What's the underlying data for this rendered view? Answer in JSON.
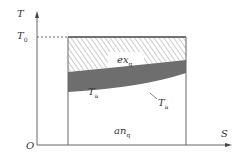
{
  "diagram": {
    "type": "T-S diagram (exergy / anergy of heat)",
    "axes": {
      "y_label": "T",
      "x_label": "S",
      "origin_label": "O",
      "reference_temperature_label": "T",
      "reference_temperature_sub": "0"
    },
    "regions": {
      "exergy": {
        "label": "ex",
        "sub": "q",
        "fill": "hatched"
      },
      "anergy": {
        "label": "an",
        "sub": "q",
        "fill": "#ffffff"
      },
      "band": {
        "label": "T",
        "sub": "a",
        "fill": "#6e6e6e"
      }
    },
    "curve_label": {
      "label": "T",
      "sub": "a",
      "prime": "′"
    },
    "colors": {
      "line": "#555555",
      "band": "#6e6e6e",
      "hatch": "#9a9a9a"
    }
  }
}
